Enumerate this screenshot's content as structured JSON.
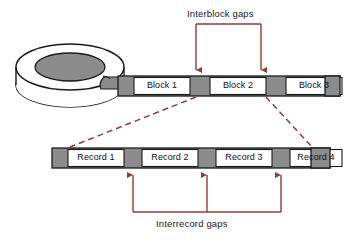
{
  "figure": {
    "type": "diagram",
    "labels": {
      "interblock": "Interblock gaps",
      "interrecord": "Interrecord gaps"
    },
    "colors": {
      "gap_fill": "#8c8c8c",
      "cell_fill": "#ffffff",
      "outline": "#1a1a1a",
      "annotation": "#8e3c3c",
      "reel_inner": "#8c8c8c",
      "reel_outer": "#ffffff",
      "background": "#ffffff"
    }
  },
  "block_strip": {
    "name": "tape-block-strip",
    "y": 76,
    "height": 20,
    "x_start": 118,
    "x_end": 340,
    "cells": [
      {
        "kind": "gap",
        "label": "",
        "x": 118,
        "w": 16
      },
      {
        "kind": "block",
        "label": "Block 1",
        "x": 134,
        "w": 56
      },
      {
        "kind": "gap",
        "label": "",
        "x": 190,
        "w": 20
      },
      {
        "kind": "block",
        "label": "Block 2",
        "x": 210,
        "w": 56
      },
      {
        "kind": "gap",
        "label": "",
        "x": 266,
        "w": 20
      },
      {
        "kind": "block",
        "label": "Block 3",
        "x": 286,
        "w": 54
      }
    ],
    "trailing_gap": {
      "x": 325,
      "w": 15
    }
  },
  "record_strip": {
    "name": "tape-record-strip",
    "y": 148,
    "height": 20,
    "x_start": 52,
    "x_end": 330,
    "cells": [
      {
        "kind": "gap",
        "label": "",
        "x": 52,
        "w": 16
      },
      {
        "kind": "record",
        "label": "Record 1",
        "x": 68,
        "w": 56
      },
      {
        "kind": "gap",
        "label": "",
        "x": 124,
        "w": 18
      },
      {
        "kind": "record",
        "label": "Record 2",
        "x": 142,
        "w": 56
      },
      {
        "kind": "gap",
        "label": "",
        "x": 198,
        "w": 18
      },
      {
        "kind": "record",
        "label": "Record 3",
        "x": 216,
        "w": 56
      },
      {
        "kind": "gap",
        "label": "",
        "x": 272,
        "w": 18
      },
      {
        "kind": "record",
        "label": "Record 4",
        "x": 290,
        "w": 56
      }
    ],
    "trailing_gap": {
      "x": 311,
      "w": 19
    }
  },
  "annotations": {
    "interblock_bracket": {
      "name": "interblock-bracket",
      "bar_y": 24,
      "left_x": 196,
      "right_x": 261,
      "arrow_tip_y": 74
    },
    "interrecord_bracket": {
      "name": "interrecord-bracket",
      "bar_y": 212,
      "left_x": 133,
      "right_x": 281,
      "mid_x": 207,
      "arrow_tip_y": 170
    },
    "expansion_lines": [
      {
        "name": "left-expansion-line",
        "x1": 196,
        "y1": 97,
        "x2": 70,
        "y2": 147
      },
      {
        "name": "right-expansion-line",
        "x1": 266,
        "y1": 97,
        "x2": 312,
        "y2": 147
      }
    ]
  },
  "tape_reel": {
    "name": "tape-reel",
    "center_x": 70,
    "center_y": 67,
    "outer_rx": 55,
    "outer_ry": 24,
    "inner_rx": 35,
    "inner_ry": 15,
    "lower_offset_y": 16,
    "tape_band": {
      "x1": 100,
      "y1": 80,
      "x2": 130,
      "y2": 92
    }
  }
}
